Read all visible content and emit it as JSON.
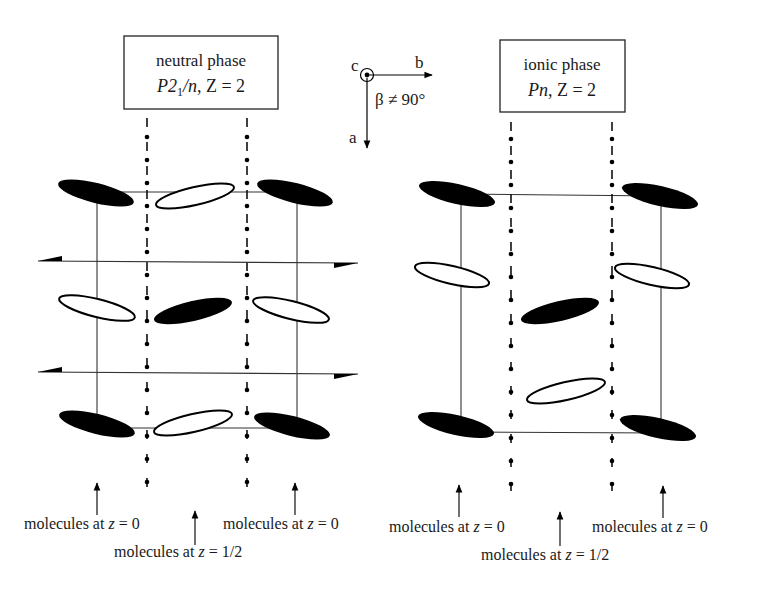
{
  "figure": {
    "ink_color": "#000000",
    "background_color": "#ffffff"
  },
  "axes_glyph": {
    "c_label": "c",
    "b_label": "b",
    "a_label": "a",
    "angle_label": "β ≠ 90°"
  },
  "panels": [
    {
      "id": "neutral",
      "title_line1": "neutral phase",
      "space_group": "P2",
      "space_group_sub": "1",
      "space_group_rest": "/n",
      "z_text": ", Z = 2",
      "symmetry": "2₁ screw axes (dash-dot with dots) and n-glide planes (half-arrow lines)",
      "labels": {
        "left": "molecules at z = 0",
        "center": "molecules at z = 1/2",
        "right": "molecules at z = 0"
      }
    },
    {
      "id": "ionic",
      "title_line1": "ionic phase",
      "space_group": "Pn",
      "space_group_sub": "",
      "space_group_rest": "",
      "z_text": ", Z = 2",
      "symmetry": "n-glide only (dash-dot with dots)",
      "labels": {
        "left": "molecules at z = 0",
        "center": "molecules at z = 1/2",
        "right": "molecules at z = 0"
      }
    }
  ],
  "label_parts": {
    "prefix": "molecules at ",
    "z": "z",
    "eq0": " = 0",
    "eqhalf": " = 1/2"
  }
}
